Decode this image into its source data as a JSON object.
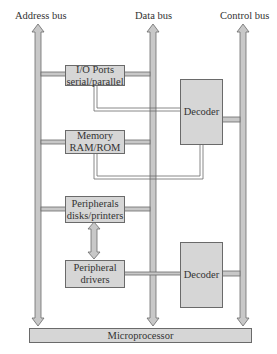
{
  "diagram": {
    "buses": [
      {
        "label": "Address bus"
      },
      {
        "label": "Data bus"
      },
      {
        "label": "Control bus"
      }
    ],
    "blocks": {
      "io_ports": {
        "line1": "I/O Ports",
        "line2": "serial/parallel"
      },
      "memory": {
        "line1": "Memory",
        "line2": "RAM/ROM"
      },
      "peripherals": {
        "line1": "Peripherals",
        "line2": "disks/printers"
      },
      "peripheral_drivers": {
        "line1": "Peripheral",
        "line2": "drivers"
      },
      "decoder_top": {
        "label": "Decoder"
      },
      "decoder_bottom": {
        "label": "Decoder"
      },
      "microprocessor": {
        "label": "Microprocessor"
      }
    },
    "colors": {
      "block_fill": "#d6d6d6",
      "bus_fill": "#c8c8c8",
      "outline": "#6a6a6a"
    }
  }
}
